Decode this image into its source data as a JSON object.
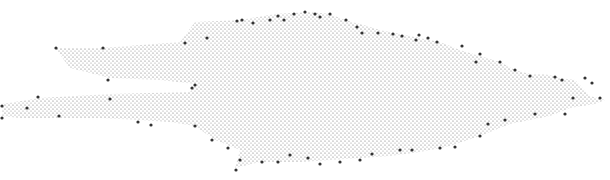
{
  "image": {
    "description": "Stippled point-cloud silhouette, elongated horizontal shape with branching arms on the left and tapering spikes on the right",
    "background": "#ffffff",
    "dot_color": "#6a6a6a",
    "node_color": "#333333",
    "dot_spacing": 4,
    "outline": [
      [
        55,
        48
      ],
      [
        102,
        48
      ],
      [
        180,
        42
      ],
      [
        195,
        22
      ],
      [
        240,
        20
      ],
      [
        275,
        14
      ],
      [
        310,
        12
      ],
      [
        330,
        14
      ],
      [
        345,
        20
      ],
      [
        360,
        24
      ],
      [
        380,
        30
      ],
      [
        410,
        36
      ],
      [
        440,
        42
      ],
      [
        460,
        50
      ],
      [
        480,
        56
      ],
      [
        500,
        62
      ],
      [
        515,
        70
      ],
      [
        530,
        74
      ],
      [
        545,
        74
      ],
      [
        560,
        78
      ],
      [
        575,
        80
      ],
      [
        590,
        96
      ],
      [
        605,
        100
      ],
      [
        595,
        104
      ],
      [
        570,
        108
      ],
      [
        550,
        116
      ],
      [
        530,
        120
      ],
      [
        510,
        124
      ],
      [
        480,
        136
      ],
      [
        450,
        146
      ],
      [
        420,
        152
      ],
      [
        390,
        156
      ],
      [
        360,
        158
      ],
      [
        330,
        160
      ],
      [
        300,
        162
      ],
      [
        260,
        162
      ],
      [
        235,
        168
      ],
      [
        240,
        150
      ],
      [
        215,
        140
      ],
      [
        195,
        126
      ],
      [
        170,
        122
      ],
      [
        140,
        120
      ],
      [
        100,
        118
      ],
      [
        60,
        118
      ],
      [
        20,
        118
      ],
      [
        2,
        116
      ],
      [
        2,
        104
      ],
      [
        40,
        98
      ],
      [
        110,
        94
      ],
      [
        190,
        92
      ],
      [
        195,
        84
      ],
      [
        160,
        80
      ],
      [
        110,
        78
      ],
      [
        70,
        68
      ]
    ],
    "nodes": [
      [
        56,
        48
      ],
      [
        103,
        48
      ],
      [
        108,
        80
      ],
      [
        185,
        43
      ],
      [
        195,
        85
      ],
      [
        192,
        88
      ],
      [
        207,
        38
      ],
      [
        237,
        21
      ],
      [
        242,
        20
      ],
      [
        253,
        23
      ],
      [
        270,
        20
      ],
      [
        278,
        16
      ],
      [
        284,
        20
      ],
      [
        294,
        14
      ],
      [
        305,
        12
      ],
      [
        315,
        14
      ],
      [
        320,
        17
      ],
      [
        330,
        14
      ],
      [
        346,
        20
      ],
      [
        357,
        27
      ],
      [
        362,
        33
      ],
      [
        378,
        33
      ],
      [
        393,
        34
      ],
      [
        402,
        36
      ],
      [
        416,
        40
      ],
      [
        419,
        35
      ],
      [
        428,
        38
      ],
      [
        437,
        42
      ],
      [
        462,
        46
      ],
      [
        480,
        54
      ],
      [
        476,
        62
      ],
      [
        500,
        62
      ],
      [
        515,
        70
      ],
      [
        530,
        76
      ],
      [
        555,
        77
      ],
      [
        562,
        80
      ],
      [
        585,
        78
      ],
      [
        592,
        83
      ],
      [
        600,
        98
      ],
      [
        573,
        98
      ],
      [
        565,
        114
      ],
      [
        535,
        114
      ],
      [
        505,
        120
      ],
      [
        488,
        124
      ],
      [
        480,
        136
      ],
      [
        455,
        147
      ],
      [
        440,
        148
      ],
      [
        412,
        150
      ],
      [
        400,
        150
      ],
      [
        372,
        154
      ],
      [
        360,
        160
      ],
      [
        340,
        162
      ],
      [
        320,
        164
      ],
      [
        308,
        158
      ],
      [
        290,
        155
      ],
      [
        278,
        162
      ],
      [
        262,
        162
      ],
      [
        240,
        160
      ],
      [
        236,
        170
      ],
      [
        228,
        148
      ],
      [
        212,
        140
      ],
      [
        195,
        126
      ],
      [
        151,
        125
      ],
      [
        138,
        122
      ],
      [
        110,
        99
      ],
      [
        38,
        97
      ],
      [
        27,
        108
      ],
      [
        2,
        106
      ],
      [
        2,
        118
      ],
      [
        59,
        116
      ]
    ]
  }
}
